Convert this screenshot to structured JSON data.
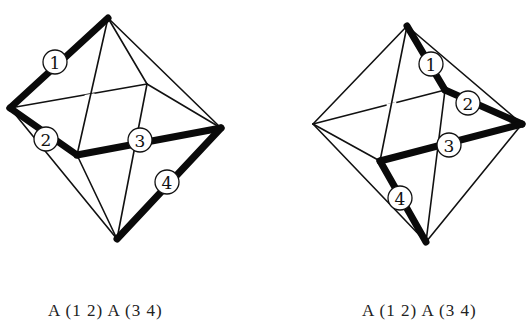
{
  "figures": [
    {
      "id": "left-octahedron",
      "caption": "A (1 2) A (3 4)",
      "vertices": {
        "top": [
          108,
          18
        ],
        "left": [
          10,
          108
        ],
        "right": [
          221,
          128
        ],
        "bottom": [
          117,
          239
        ],
        "front": [
          77,
          155
        ],
        "back": [
          147,
          84
        ]
      },
      "thick_edges": [
        {
          "label": "1",
          "from": "top",
          "to": "left",
          "label_pos": [
            55,
            62
          ]
        },
        {
          "label": "2",
          "from": "left",
          "to": "front",
          "label_pos": [
            46,
            139
          ]
        },
        {
          "label": "3",
          "from": "front",
          "to": "right",
          "label_pos": [
            140,
            140
          ]
        },
        {
          "label": "4",
          "from": "right",
          "to": "bottom",
          "label_pos": [
            167,
            182
          ]
        }
      ],
      "thin_edges": [
        [
          "top",
          "front"
        ],
        [
          "top",
          "right"
        ],
        [
          "top",
          "back"
        ],
        [
          "back",
          "right"
        ],
        [
          "back",
          "bottom"
        ],
        [
          "left",
          "bottom"
        ],
        [
          "front",
          "bottom"
        ]
      ],
      "broken_edge": {
        "from": "left",
        "to": "back",
        "gap_at": [
          90,
          97
        ]
      }
    },
    {
      "id": "right-octahedron",
      "caption": "A (1 2) A (3 4)",
      "vertices": {
        "top": [
          407,
          26
        ],
        "left": [
          313,
          124
        ],
        "right": [
          522,
          124
        ],
        "bottom": [
          426,
          242
        ],
        "front": [
          380,
          161
        ],
        "back": [
          445,
          90
        ]
      },
      "thick_edges": [
        {
          "label": "1",
          "from": "top",
          "to": "back",
          "label_pos": [
            431,
            64
          ]
        },
        {
          "label": "2",
          "from": "back",
          "to": "right",
          "label_pos": [
            468,
            103
          ]
        },
        {
          "label": "3",
          "from": "front",
          "to": "right",
          "label_pos": [
            449,
            145
          ]
        },
        {
          "label": "4",
          "from": "front",
          "to": "bottom",
          "label_pos": [
            400,
            198
          ]
        }
      ],
      "thin_edges": [
        [
          "top",
          "left"
        ],
        [
          "top",
          "right"
        ],
        [
          "top",
          "front"
        ],
        [
          "left",
          "front"
        ],
        [
          "left",
          "bottom"
        ],
        [
          "right",
          "bottom"
        ],
        [
          "back",
          "bottom"
        ]
      ],
      "broken_edge": {
        "from": "left",
        "to": "back",
        "gap_at": [
          392,
          106
        ]
      }
    }
  ],
  "style": {
    "line_color": "#111111",
    "background": "#ffffff"
  }
}
